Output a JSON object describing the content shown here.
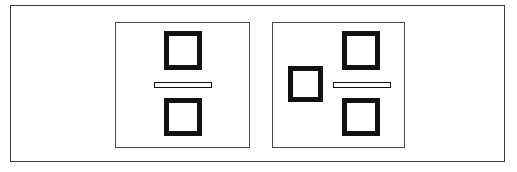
{
  "figure": {
    "domain": "Diagram",
    "title": "",
    "width": 517,
    "height": 172,
    "background_color": "#ffffff"
  },
  "colors": {
    "background": "#ffffff",
    "outer_frame_stroke": "#3a3a3a",
    "panel_stroke": "#4a4a4a",
    "node_stroke": "#111111",
    "node_fill": "#ffffff",
    "bar_stroke": "#111111",
    "bar_fill": "#ffffff"
  },
  "outer_frame": {
    "label": "",
    "stroke_width": 1
  },
  "panels": [
    {
      "id": "panel-left",
      "label": "",
      "stroke_width": 1,
      "nodes": [
        {
          "id": "left-square-top",
          "shape": "square",
          "label": "",
          "stroke_width": 5,
          "position": "top"
        },
        {
          "id": "left-bar",
          "shape": "bar",
          "label": "",
          "stroke_width": 1,
          "position": "middle"
        },
        {
          "id": "left-square-bottom",
          "shape": "square",
          "label": "",
          "stroke_width": 5,
          "position": "bottom"
        }
      ]
    },
    {
      "id": "panel-right",
      "label": "",
      "stroke_width": 1,
      "nodes": [
        {
          "id": "right-square-top",
          "shape": "square",
          "label": "",
          "stroke_width": 5,
          "position": "top-right"
        },
        {
          "id": "right-square-side",
          "shape": "square",
          "label": "",
          "stroke_width": 5,
          "position": "middle-left"
        },
        {
          "id": "right-bar",
          "shape": "bar",
          "label": "",
          "stroke_width": 1,
          "position": "middle-right"
        },
        {
          "id": "right-square-bottom",
          "shape": "square",
          "label": "",
          "stroke_width": 5,
          "position": "bottom-right"
        }
      ]
    }
  ]
}
